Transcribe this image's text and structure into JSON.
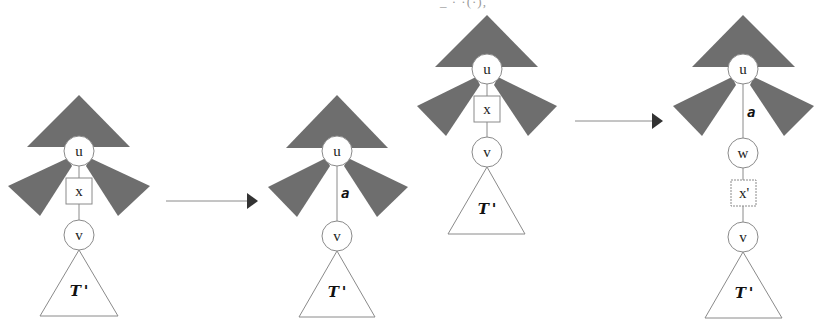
{
  "caption_fragment": "_ · ·(·),",
  "colors": {
    "dark_region": "#6e6e6e",
    "line": "#8a8a8a",
    "text": "#222222",
    "background": "#ffffff"
  },
  "diagrams": [
    {
      "id": "left-before",
      "nodes": {
        "u": "u",
        "x_box": "x",
        "v": "v"
      },
      "subtree": "T '"
    },
    {
      "id": "left-after",
      "nodes": {
        "u": "u",
        "v": "v"
      },
      "edge_label": "a",
      "subtree": "T '"
    },
    {
      "id": "right-before",
      "nodes": {
        "u": "u",
        "x_box": "x",
        "v": "v"
      },
      "subtree": "T '"
    },
    {
      "id": "right-after",
      "nodes": {
        "u": "u",
        "w": "w",
        "x_box": "x'",
        "v": "v"
      },
      "edge_label": "a",
      "subtree": "T '"
    }
  ],
  "arrows": [
    {
      "id": "arrow-1",
      "from": "left-before",
      "to": "left-after"
    },
    {
      "id": "arrow-2",
      "from": "right-before",
      "to": "right-after"
    }
  ]
}
